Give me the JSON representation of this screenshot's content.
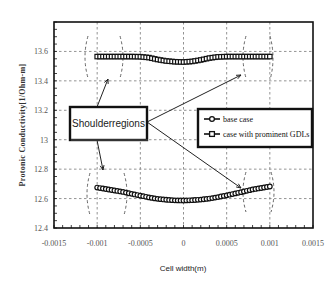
{
  "chart_data": {
    "type": "line",
    "title": "",
    "xlabel": "Cell width(m)",
    "ylabel": "Protonic Conductivity[1/Ohm-m]",
    "xlim": [
      -0.0015,
      0.0015
    ],
    "ylim": [
      12.4,
      13.8
    ],
    "x_ticks": [
      "-0.0015",
      "-0.001",
      "-0.0005",
      "0",
      "0.0005",
      "0.001",
      "0.0015"
    ],
    "x_tick_values": [
      -0.0015,
      -0.001,
      -0.0005,
      0,
      0.0005,
      0.001,
      0.0015
    ],
    "y_ticks": [
      "12.4",
      "12.6",
      "12.8",
      "13",
      "13.2",
      "13.4",
      "13.6"
    ],
    "y_tick_values": [
      12.4,
      12.6,
      12.8,
      13.0,
      13.2,
      13.4,
      13.6
    ],
    "grid": true,
    "legend_position": "inside-right-middle",
    "x": [
      -0.001,
      -0.0009,
      -0.0008,
      -0.0007,
      -0.0006,
      -0.0005,
      -0.0004,
      -0.0003,
      -0.0002,
      -0.0001,
      0,
      0.0001,
      0.0002,
      0.0003,
      0.0004,
      0.0005,
      0.0006,
      0.0007,
      0.0008,
      0.0009,
      0.001
    ],
    "series": [
      {
        "name": "base case",
        "marker": "circle",
        "values": [
          12.675,
          12.665,
          12.655,
          12.645,
          12.632,
          12.62,
          12.608,
          12.598,
          12.592,
          12.588,
          12.587,
          12.589,
          12.593,
          12.6,
          12.61,
          12.622,
          12.635,
          12.648,
          12.662,
          12.672,
          12.682
        ]
      },
      {
        "name": "case with prominent GDLs",
        "marker": "square",
        "values": [
          13.565,
          13.565,
          13.565,
          13.565,
          13.565,
          13.564,
          13.558,
          13.545,
          13.535,
          13.53,
          13.528,
          13.532,
          13.542,
          13.555,
          13.563,
          13.565,
          13.565,
          13.565,
          13.565,
          13.565,
          13.565
        ]
      }
    ],
    "annotations": [
      {
        "text": "Shoulderregions",
        "type": "callout-box",
        "arrows_to": [
          "top-left shoulder",
          "top-right shoulder",
          "bottom-left shoulder",
          "bottom-right shoulder"
        ]
      }
    ]
  },
  "legend": {
    "items": [
      {
        "label": "base case",
        "marker": "circle"
      },
      {
        "label": "case with prominent GDLs",
        "marker": "square"
      }
    ]
  },
  "callout": {
    "label": "Shoulderregions"
  },
  "axes": {
    "x_title": "Cell width(m)",
    "y_title": "Protonic Conductivity[1/Ohm-m]"
  }
}
